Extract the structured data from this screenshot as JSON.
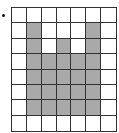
{
  "figure": {
    "bullet": "•",
    "grid": {
      "rows": 8,
      "cols": 7,
      "fill_color": "#a9a9a9",
      "empty_color": "#ffffff",
      "cells": [
        [
          0,
          0,
          0,
          0,
          0,
          0,
          0
        ],
        [
          0,
          1,
          0,
          0,
          0,
          1,
          0
        ],
        [
          0,
          1,
          0,
          1,
          0,
          1,
          0
        ],
        [
          0,
          1,
          1,
          1,
          1,
          1,
          0
        ],
        [
          0,
          1,
          1,
          1,
          1,
          1,
          0
        ],
        [
          0,
          1,
          1,
          1,
          1,
          1,
          0
        ],
        [
          0,
          1,
          1,
          1,
          1,
          1,
          0
        ],
        [
          0,
          0,
          0,
          0,
          0,
          0,
          0
        ]
      ]
    }
  }
}
